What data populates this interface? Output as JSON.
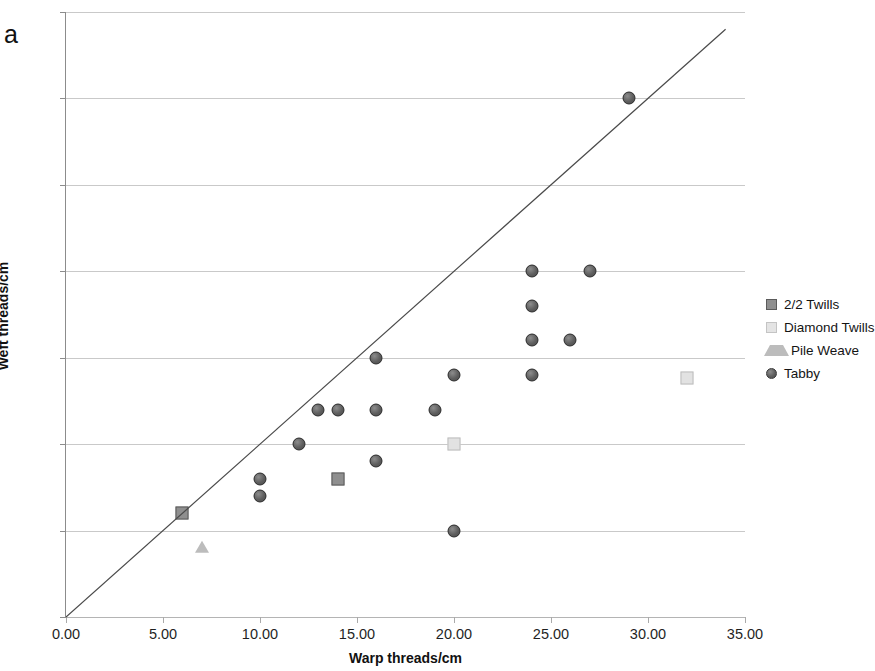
{
  "figure": {
    "panel_letter": "a"
  },
  "chart_data": {
    "type": "scatter",
    "title": "",
    "xlabel": "Warp threads/cm",
    "ylabel": "Weft threads/cm",
    "xlim": [
      0,
      35
    ],
    "ylim": [
      0,
      35
    ],
    "xticks": [
      0,
      5,
      10,
      15,
      20,
      25,
      30,
      35
    ],
    "yticks": [
      0,
      5,
      10,
      15,
      20,
      25,
      30,
      35
    ],
    "xtick_labels": [
      "0.00",
      "5.00",
      "10.00",
      "15.00",
      "20.00",
      "25.00",
      "30.00",
      "35.00"
    ],
    "ytick_labels": [
      "0.00",
      "5.00",
      "10.00",
      "15.00",
      "20.00",
      "25.00",
      "30.00",
      "35.00"
    ],
    "grid": "horizontal",
    "legend_position": "right",
    "reference_line": {
      "label": "1:1 diagonal",
      "from": [
        0,
        0
      ],
      "to": [
        34,
        34
      ],
      "color": "#4a4a4a"
    },
    "series": [
      {
        "name": "2/2 Twills",
        "marker": "square",
        "color": "#8f8f8f",
        "edge_color": "#5b5b5b",
        "points": [
          {
            "x": 6,
            "y": 6
          },
          {
            "x": 14,
            "y": 8
          }
        ]
      },
      {
        "name": "Diamond Twills",
        "marker": "square",
        "color": "#e2e2e2",
        "edge_color": "#bdbdbd",
        "points": [
          {
            "x": 20,
            "y": 10
          },
          {
            "x": 32,
            "y": 13.8
          }
        ]
      },
      {
        "name": "Pile Weave",
        "marker": "triangle",
        "color": "#bcbcbc",
        "edge_color": "#a8a8a8",
        "points": [
          {
            "x": 7,
            "y": 4
          }
        ]
      },
      {
        "name": "Tabby",
        "marker": "circle",
        "color": "#5e5e5e",
        "edge_color": "#2f2f2f",
        "points": [
          {
            "x": 10,
            "y": 8
          },
          {
            "x": 10,
            "y": 7
          },
          {
            "x": 12,
            "y": 10
          },
          {
            "x": 13,
            "y": 12
          },
          {
            "x": 14,
            "y": 12
          },
          {
            "x": 16,
            "y": 15
          },
          {
            "x": 16,
            "y": 12
          },
          {
            "x": 16,
            "y": 9
          },
          {
            "x": 19,
            "y": 12
          },
          {
            "x": 20,
            "y": 14
          },
          {
            "x": 20,
            "y": 5
          },
          {
            "x": 24,
            "y": 20
          },
          {
            "x": 24,
            "y": 18
          },
          {
            "x": 24,
            "y": 16
          },
          {
            "x": 24,
            "y": 14
          },
          {
            "x": 26,
            "y": 16
          },
          {
            "x": 27,
            "y": 20
          },
          {
            "x": 29,
            "y": 30
          }
        ]
      }
    ]
  },
  "legend": {
    "items": [
      {
        "label": "2/2 Twills",
        "swatch": "sq-dark"
      },
      {
        "label": "Diamond Twills",
        "swatch": "sq-light"
      },
      {
        "label": "Pile Weave",
        "swatch": "tri"
      },
      {
        "label": "Tabby",
        "swatch": "circ"
      }
    ]
  }
}
